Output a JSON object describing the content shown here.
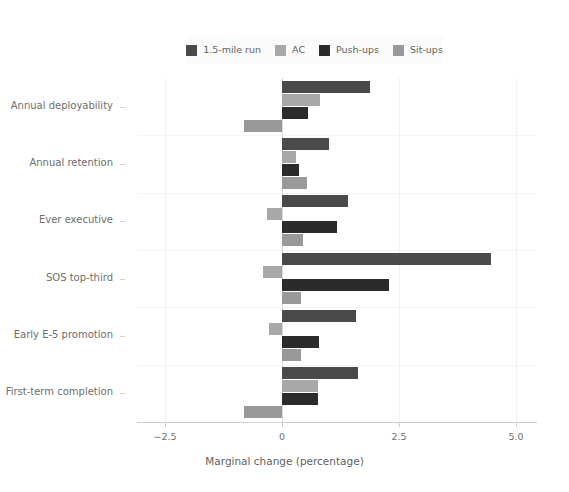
{
  "chart_data": {
    "type": "bar",
    "orientation": "horizontal",
    "title": "",
    "xlabel": "Marginal change (percentage)",
    "ylabel": "",
    "xlim": [
      -3.1,
      5.45
    ],
    "xticks": [
      -2.5,
      0,
      2.5,
      5.0
    ],
    "xtick_labels": [
      "−2.5",
      "0",
      "2.5",
      "5.0"
    ],
    "grid": true,
    "legend_position": "top",
    "categories": [
      "Annual deployability",
      "Annual retention",
      "Ever executive",
      "SOS top-third",
      "Early E-5 promotion",
      "First-term completion"
    ],
    "series": [
      {
        "name": "1.5-mile run",
        "color": "#4a4a4a",
        "values": [
          1.88,
          1.0,
          1.4,
          4.47,
          1.58,
          1.62
        ]
      },
      {
        "name": "AC",
        "color": "#a8a8a8",
        "values": [
          0.82,
          0.3,
          -0.32,
          -0.4,
          -0.28,
          0.77
        ]
      },
      {
        "name": "Push-ups",
        "color": "#2b2b2b",
        "values": [
          0.56,
          0.37,
          1.17,
          2.29,
          0.79,
          0.77
        ]
      },
      {
        "name": "Sit-ups",
        "color": "#999999",
        "values": [
          -0.81,
          0.53,
          0.45,
          0.41,
          0.41,
          -0.82
        ]
      }
    ]
  },
  "legend": {
    "items": [
      {
        "label": "1.5-mile run",
        "color": "#4a4a4a"
      },
      {
        "label": "AC",
        "color": "#a8a8a8"
      },
      {
        "label": "Push-ups",
        "color": "#2b2b2b"
      },
      {
        "label": "Sit-ups",
        "color": "#999999"
      }
    ]
  },
  "axes": {
    "x_title": "Marginal change (percentage)",
    "x_tick_labels": [
      "−2.5",
      "0",
      "2.5",
      "5.0"
    ],
    "y_tick_labels": [
      "Annual deployability",
      "Annual retention",
      "Ever executive",
      "SOS top-third",
      "Early E-5 promotion",
      "First-term completion"
    ]
  }
}
